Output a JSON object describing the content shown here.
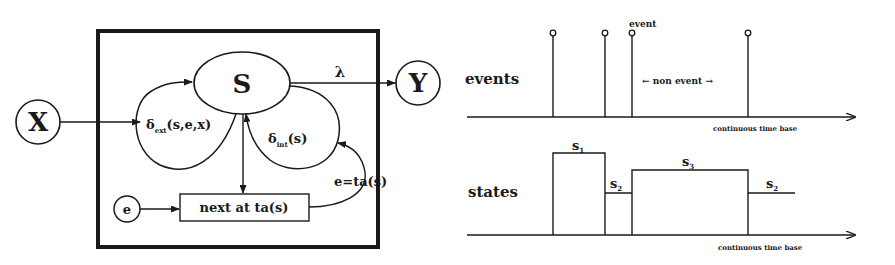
{
  "devs_model": {
    "input_node": "X",
    "output_node": "Y",
    "state_node": "S",
    "clock_node": "e",
    "output_function": "λ",
    "external_transition": {
      "symbol": "δ",
      "subscript": "ext",
      "args": "(s,e,x)"
    },
    "internal_transition": {
      "symbol": "δ",
      "subscript": "int",
      "args": "(s)"
    },
    "time_advance_box": "next at  ta(s)",
    "timeout_condition": "e=ta(s)"
  },
  "timeline": {
    "events_axis": {
      "label": "events",
      "axis_label": "continuous time base"
    },
    "event_annotation": "event",
    "non_event_annotation": "← non event →",
    "states_axis": {
      "label": "states",
      "axis_label": "continuous time base"
    },
    "state_labels": [
      {
        "base": "s",
        "sub": "1"
      },
      {
        "base": "s",
        "sub": "2"
      },
      {
        "base": "s",
        "sub": "3"
      },
      {
        "base": "s",
        "sub": "2"
      }
    ]
  },
  "colors": {
    "ink": "#1a1a1a",
    "background": "#ffffff"
  }
}
